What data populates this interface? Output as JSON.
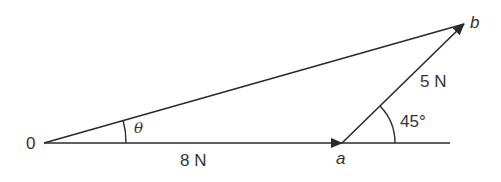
{
  "diagram": {
    "type": "vector-triangle",
    "points": {
      "origin": "0",
      "a": "a",
      "b": "b"
    },
    "labels": {
      "origin": "0",
      "theta": "θ",
      "oa_magnitude": "8 N",
      "ab_magnitude": "5 N",
      "angle": "45°",
      "point_a": "a",
      "point_b": "b"
    },
    "colors": {
      "line": "#2a2a2a",
      "text": "#333333"
    }
  }
}
